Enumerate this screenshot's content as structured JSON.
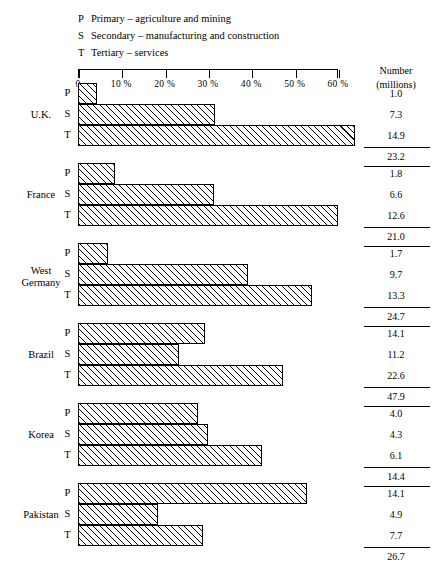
{
  "legend": [
    {
      "key": "P",
      "text": "Primary – agriculture and mining"
    },
    {
      "key": "S",
      "text": "Secondary – manufacturing and construction"
    },
    {
      "key": "T",
      "text": "Tertiary – services"
    }
  ],
  "number_column": {
    "line1": "Number",
    "line2": "(millions)"
  },
  "chart_data": {
    "type": "bar",
    "orientation": "horizontal",
    "title": "",
    "xlabel": "",
    "ylabel": "",
    "xlim": [
      0,
      60
    ],
    "x_unit": "%",
    "grid": false,
    "legend_position": "top-left",
    "tick_labels": [
      "0",
      "10 %",
      "20 %",
      "30 %",
      "40 %",
      "50 %",
      "60 %"
    ],
    "tick_values": [
      0,
      10,
      20,
      30,
      40,
      50,
      60
    ],
    "sector_keys": [
      "P",
      "S",
      "T"
    ],
    "sector_names": [
      "Primary – agriculture and mining",
      "Secondary – manufacturing and construction",
      "Tertiary – services"
    ],
    "value_column_header": "Number (millions)",
    "categories": [
      "U.K.",
      "France",
      "West Germany",
      "Brazil",
      "Korea",
      "Pakistan"
    ],
    "groups": [
      {
        "country": "U.K.",
        "country_line1": "U.K.",
        "country_line2": "",
        "percents": [
          4.3,
          31.5,
          64.0
        ],
        "values": [
          "1.0",
          "7.3",
          "14.9"
        ],
        "total": "23.2"
      },
      {
        "country": "France",
        "country_line1": "France",
        "country_line2": "",
        "percents": [
          8.6,
          31.4,
          60.0
        ],
        "values": [
          "1.8",
          "6.6",
          "12.6"
        ],
        "total": "21.0"
      },
      {
        "country": "West Germany",
        "country_line1": "West",
        "country_line2": "Germany",
        "percents": [
          6.9,
          39.3,
          53.9
        ],
        "values": [
          "1.7",
          "9.7",
          "13.3"
        ],
        "total": "24.7"
      },
      {
        "country": "Brazil",
        "country_line1": "Brazil",
        "country_line2": "",
        "percents": [
          29.4,
          23.4,
          47.2
        ],
        "values": [
          "14.1",
          "11.2",
          "22.6"
        ],
        "total": "47.9"
      },
      {
        "country": "Korea",
        "country_line1": "Korea",
        "country_line2": "",
        "percents": [
          27.8,
          29.9,
          42.4
        ],
        "values": [
          "4.0",
          "4.3",
          "6.1"
        ],
        "total": "14.4"
      },
      {
        "country": "Pakistan",
        "country_line1": "Pakistan",
        "country_line2": "",
        "percents": [
          52.8,
          18.4,
          28.8
        ],
        "values": [
          "14.1",
          "4.9",
          "7.7"
        ],
        "total": "26.7"
      }
    ]
  }
}
